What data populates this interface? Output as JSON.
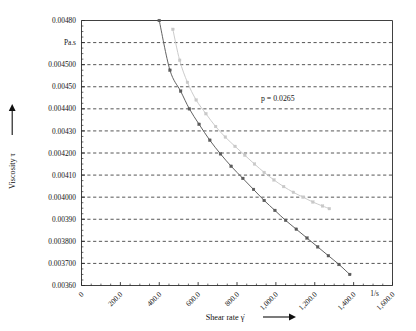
{
  "chart_data": {
    "type": "line",
    "title": "",
    "xlabel": "Shear rate γ̇",
    "ylabel": "Viscosity τ",
    "xunit": "1/s",
    "yunit": "Pa.s",
    "xlim": [
      0,
      1600
    ],
    "ylim": [
      0.0036,
      0.0048
    ],
    "grid": true,
    "grid_style": "dashed-horizontal",
    "legend": "none",
    "xticks": [
      0,
      200,
      400,
      600,
      800,
      1000,
      1200,
      1400,
      1600
    ],
    "xtick_labels": [
      "0",
      "200.0",
      "400.0",
      "600.0",
      "800.0",
      "1,000.0",
      "1,200.0",
      "1,400.0",
      "1,600.0"
    ],
    "xtick_rotation_deg": 45,
    "yticks": [
      0.0048,
      0.0047,
      0.0045,
      0.0045,
      0.0044,
      0.0043,
      0.0042,
      0.0041,
      0.004,
      0.0039,
      0.0038,
      0.0037,
      0.0036
    ],
    "ytick_labels": [
      "0.00480",
      "Pa.s",
      "0.004500",
      "0.00450",
      "0.004400",
      "0.00430",
      "0.004200",
      "0.00410",
      "0.004000",
      "0.00390",
      "0.003800",
      "0.003700",
      "0.00360"
    ],
    "annotations": [
      {
        "text": "p = 0.0265",
        "x": 1010,
        "y": 0.004435
      }
    ],
    "series": [
      {
        "name": "curve-dark",
        "color": "#5a5a5a",
        "marker": "square",
        "points": [
          {
            "x": 400,
            "y": 0.0048
          },
          {
            "x": 455,
            "y": 0.004575
          },
          {
            "x": 510,
            "y": 0.00448
          },
          {
            "x": 555,
            "y": 0.0044
          },
          {
            "x": 605,
            "y": 0.00433
          },
          {
            "x": 660,
            "y": 0.004258
          },
          {
            "x": 715,
            "y": 0.004196
          },
          {
            "x": 770,
            "y": 0.00414
          },
          {
            "x": 830,
            "y": 0.004085
          },
          {
            "x": 885,
            "y": 0.004035
          },
          {
            "x": 940,
            "y": 0.003985
          },
          {
            "x": 995,
            "y": 0.00394
          },
          {
            "x": 1050,
            "y": 0.003895
          },
          {
            "x": 1105,
            "y": 0.003855
          },
          {
            "x": 1160,
            "y": 0.003815
          },
          {
            "x": 1215,
            "y": 0.003775
          },
          {
            "x": 1270,
            "y": 0.003735
          },
          {
            "x": 1325,
            "y": 0.003695
          },
          {
            "x": 1380,
            "y": 0.00365
          }
        ]
      },
      {
        "name": "curve-light",
        "color": "#c8c8c8",
        "marker": "square",
        "points": [
          {
            "x": 470,
            "y": 0.00476
          },
          {
            "x": 505,
            "y": 0.00462
          },
          {
            "x": 545,
            "y": 0.00452
          },
          {
            "x": 590,
            "y": 0.00444
          },
          {
            "x": 640,
            "y": 0.004378
          },
          {
            "x": 690,
            "y": 0.00432
          },
          {
            "x": 740,
            "y": 0.004272
          },
          {
            "x": 790,
            "y": 0.00423
          },
          {
            "x": 840,
            "y": 0.00419
          },
          {
            "x": 890,
            "y": 0.00415
          },
          {
            "x": 940,
            "y": 0.004112
          },
          {
            "x": 990,
            "y": 0.004078
          },
          {
            "x": 1040,
            "y": 0.004048
          },
          {
            "x": 1090,
            "y": 0.004022
          },
          {
            "x": 1140,
            "y": 0.004
          },
          {
            "x": 1190,
            "y": 0.003978
          },
          {
            "x": 1240,
            "y": 0.00396
          },
          {
            "x": 1275,
            "y": 0.003948
          }
        ]
      }
    ]
  }
}
